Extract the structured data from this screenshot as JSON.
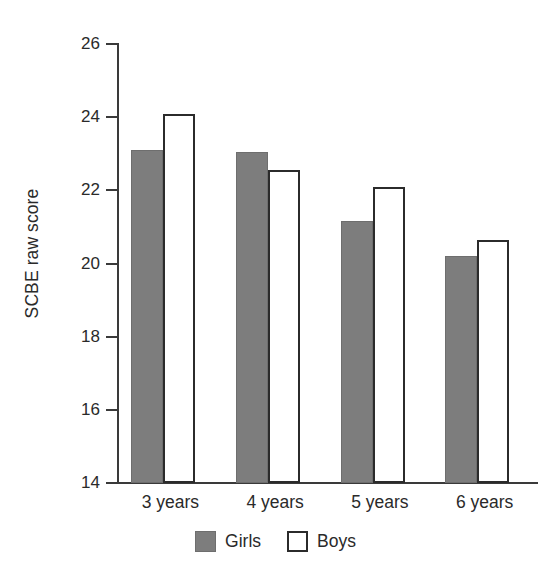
{
  "chart_data": {
    "type": "bar",
    "title": "",
    "subtitle": "",
    "xlabel": "",
    "ylabel": "SCBE raw score",
    "categories": [
      "3 years",
      "4 years",
      "5 years",
      "6 years"
    ],
    "series": [
      {
        "name": "Girls",
        "color": "#7d7d7d",
        "style": "filled-gray",
        "values": [
          23.1,
          23.05,
          21.15,
          20.2
        ]
      },
      {
        "name": "Boys",
        "color": "#ffffff",
        "style": "white-outlined",
        "values": [
          24.1,
          22.55,
          22.1,
          20.65
        ]
      }
    ],
    "ylim": [
      14,
      26
    ],
    "yticks": [
      14,
      16,
      18,
      20,
      22,
      24,
      26
    ],
    "ytick_labels": [
      "14",
      "16",
      "18",
      "20",
      "22",
      "24",
      "26"
    ],
    "grid": false,
    "legend_position": "bottom-center",
    "annotations": []
  },
  "axis": {
    "y_title": "SCBE raw score"
  },
  "legend": {
    "items": [
      {
        "label": "Girls",
        "swatch": "filled-gray-swatch"
      },
      {
        "label": "Boys",
        "swatch": "white-outline-swatch"
      }
    ]
  }
}
